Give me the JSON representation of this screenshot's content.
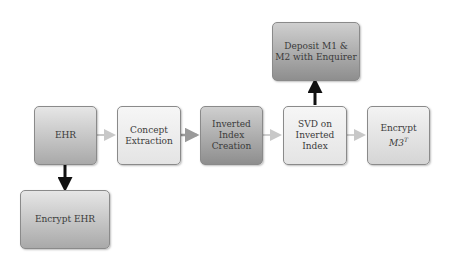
{
  "diagram": {
    "nodes": [
      {
        "id": "ehr",
        "label": "EHR"
      },
      {
        "id": "concept_extraction",
        "label": "Concept\nExtraction"
      },
      {
        "id": "inverted_index_creation",
        "label": "Inverted\nIndex\nCreation"
      },
      {
        "id": "svd",
        "label": "SVD on\nInverted\nIndex"
      },
      {
        "id": "encrypt_m3t",
        "label_prefix": "Encrypt ",
        "label_math": "M3",
        "label_sup": "T"
      },
      {
        "id": "deposit",
        "label": "Deposit M1 &\nM2 with Enquirer"
      },
      {
        "id": "encrypt_ehr",
        "label": "Encrypt EHR"
      }
    ],
    "edges": [
      {
        "from": "ehr",
        "to": "concept_extraction",
        "style": "light"
      },
      {
        "from": "concept_extraction",
        "to": "inverted_index_creation",
        "style": "medium"
      },
      {
        "from": "inverted_index_creation",
        "to": "svd",
        "style": "light"
      },
      {
        "from": "svd",
        "to": "encrypt_m3t",
        "style": "light"
      },
      {
        "from": "svd",
        "to": "deposit",
        "style": "bold"
      },
      {
        "from": "ehr",
        "to": "encrypt_ehr",
        "style": "bold"
      }
    ]
  }
}
